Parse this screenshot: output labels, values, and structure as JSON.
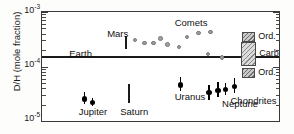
{
  "chart_data": {
    "type": "scatter",
    "title": "",
    "xlabel": "",
    "ylabel": "D/H (mole fraction)",
    "yscale": "log",
    "ylim": [
      1e-05,
      0.001
    ],
    "ytick_labels": [
      "10",
      "10",
      "10"
    ],
    "ytick_exponents": [
      "-3",
      "-4",
      "-5"
    ],
    "ytick_values": [
      0.001,
      0.0001,
      1e-05
    ],
    "grid": false,
    "legend": "none",
    "annotations": [
      {
        "name": "earth-label",
        "text": "Earth",
        "x": 0.115,
        "y": 0.00017
      },
      {
        "name": "mars-label",
        "text": "Mars",
        "x": 0.275,
        "y": 0.0004
      },
      {
        "name": "comets-label",
        "text": "Comets",
        "x": 0.56,
        "y": 0.00062
      },
      {
        "name": "jupiter-label",
        "text": "Jupiter",
        "x": 0.155,
        "y": 1.45e-05
      },
      {
        "name": "saturn-label",
        "text": "Saturn",
        "x": 0.33,
        "y": 1.45e-05
      },
      {
        "name": "uranus-label",
        "text": "Uranus",
        "x": 0.56,
        "y": 2.8e-05
      },
      {
        "name": "neptune-label",
        "text": "Neptune",
        "x": 0.76,
        "y": 2.05e-05
      },
      {
        "name": "chondrites-label",
        "text": "Chondrites",
        "x": 0.905,
        "y": 2.3e-05
      }
    ],
    "series": [
      {
        "name": "Earth",
        "type": "hline",
        "color": "#1a1a1a",
        "value": 0.000149
      },
      {
        "name": "Mars",
        "type": "range-bar",
        "color": "#1a1a1a",
        "x": 0.355,
        "ylow": 0.000205,
        "yhigh": 0.00036
      },
      {
        "name": "Comets",
        "type": "scatter",
        "color": "#9d9d9d",
        "points": [
          {
            "x": 0.392,
            "y": 0.000305
          },
          {
            "x": 0.432,
            "y": 0.000272
          },
          {
            "x": 0.47,
            "y": 0.00027
          },
          {
            "x": 0.5,
            "y": 0.000325
          },
          {
            "x": 0.53,
            "y": 0.000255
          },
          {
            "x": 0.578,
            "y": 0.000228
          },
          {
            "x": 0.612,
            "y": 0.00035
          },
          {
            "x": 0.66,
            "y": 0.00041
          },
          {
            "x": 0.712,
            "y": 0.00043
          },
          {
            "x": 0.7,
            "y": 0.00017
          },
          {
            "x": 0.76,
            "y": 0.000145
          }
        ]
      },
      {
        "name": "Jupiter",
        "type": "errorbar",
        "color": "#000000",
        "points": [
          {
            "x": 0.18,
            "y": 2.55e-05,
            "ylow": 2.05e-05,
            "yhigh": 3.35e-05
          },
          {
            "x": 0.212,
            "y": 2.18e-05,
            "ylow": 1.88e-05,
            "yhigh": 2.6e-05
          }
        ]
      },
      {
        "name": "Saturn",
        "type": "range-bar",
        "color": "#1a1a1a",
        "x": 0.368,
        "ylow": 2.1e-05,
        "yhigh": 4.7e-05
      },
      {
        "name": "Uranus",
        "type": "errorbar",
        "color": "#000000",
        "points": [
          {
            "x": 0.585,
            "y": 4.55e-05,
            "ylow": 3.6e-05,
            "yhigh": 6.4e-05
          }
        ]
      },
      {
        "name": "Neptune",
        "type": "errorbar",
        "color": "#000000",
        "points": [
          {
            "x": 0.742,
            "y": 3.65e-05,
            "ylow": 2.75e-05,
            "yhigh": 5.2e-05
          },
          {
            "x": 0.775,
            "y": 3.8e-05,
            "ylow": 3.05e-05,
            "yhigh": 5e-05
          },
          {
            "x": 0.812,
            "y": 4.3e-05,
            "ylow": 3.2e-05,
            "yhigh": 6.1e-05
          },
          {
            "x": 0.705,
            "y": 3.3e-05,
            "ylow": 2.4e-05,
            "yhigh": 4.6e-05
          }
        ]
      },
      {
        "name": "Chondrites",
        "type": "boxes",
        "x": 0.872,
        "boxes": [
          {
            "label": "Ord.",
            "ylow": 0.000285,
            "yhigh": 0.000425,
            "fill": "ord"
          },
          {
            "label": "Carb.",
            "ylow": 0.000102,
            "yhigh": 0.00028,
            "fill": "carb"
          },
          {
            "label": "Ord.",
            "ylow": 6.2e-05,
            "yhigh": 9.5e-05,
            "fill": "ord"
          }
        ]
      }
    ]
  },
  "axis": {
    "ylabel": "D/H (mole fraction)"
  },
  "legend_labels": {
    "ord_top": "Ord.",
    "carb": "Carb.",
    "ord_bottom": "Ord.",
    "chondrites": "Chondrites"
  }
}
